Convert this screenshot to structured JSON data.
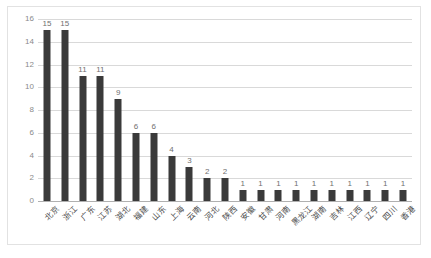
{
  "chart_data": {
    "type": "bar",
    "title": "",
    "xlabel": "",
    "ylabel": "",
    "ylim": [
      0,
      16
    ],
    "yticks": [
      0,
      2,
      4,
      6,
      8,
      10,
      12,
      14,
      16
    ],
    "grid": true,
    "legend": "none",
    "bar_color": "#3a3a3a",
    "gridline_color": "#d9d9d9",
    "categories": [
      "北京",
      "浙江",
      "广东",
      "江苏",
      "湖北",
      "福建",
      "山东",
      "上海",
      "云南",
      "河北",
      "陕西",
      "安徽",
      "甘肃",
      "河南",
      "黑龙江",
      "湖南",
      "吉林",
      "江西",
      "辽宁",
      "四川",
      "香港"
    ],
    "values": [
      15,
      15,
      11,
      11,
      9,
      6,
      6,
      4,
      3,
      2,
      2,
      1,
      1,
      1,
      1,
      1,
      1,
      1,
      1,
      1,
      1
    ],
    "data_labels": [
      "15",
      "15",
      "11",
      "11",
      "9",
      "6",
      "6",
      "4",
      "3",
      "2",
      "2",
      "1",
      "1",
      "1",
      "1",
      "1",
      "1",
      "1",
      "1",
      "1",
      "1"
    ]
  },
  "caption": ""
}
